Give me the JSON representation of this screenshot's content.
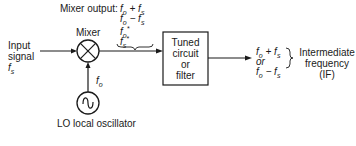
{
  "input": {
    "line1": "Input",
    "line2": "signal",
    "freq": "fs"
  },
  "mixer": {
    "label": "Mixer",
    "output_label": "Mixer output:",
    "outputs": [
      "fo + fs",
      "fo − fs",
      "fo*",
      "fs*"
    ]
  },
  "lo": {
    "freq": "fo",
    "label": "LO local oscillator"
  },
  "filter": {
    "lines": [
      "Tuned",
      "circuit",
      "or",
      "filter"
    ]
  },
  "result": {
    "line1": "fo + fs",
    "or": "or",
    "line2": "fo − fs",
    "label_lines": [
      "Intermediate",
      "frequency",
      "(IF)"
    ]
  },
  "colors": {
    "stroke": "#1a1a1a",
    "background": "#ffffff"
  }
}
